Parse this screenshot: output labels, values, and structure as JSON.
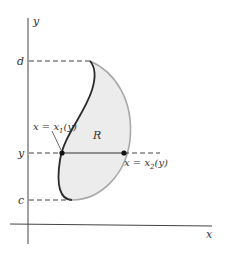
{
  "diagram": {
    "type": "region-between-curves",
    "axes": {
      "x_label": "x",
      "y_label": "y"
    },
    "levels": {
      "top": "d",
      "middle": "y",
      "bottom": "c"
    },
    "region_label": "R",
    "left_curve_label": {
      "lhs": "x = x",
      "sub": "1",
      "rhs": "(y)"
    },
    "right_curve_label": {
      "lhs": "x = x",
      "sub": "2",
      "rhs": "(y)"
    },
    "colors": {
      "region_fill": "#ececec",
      "left_curve": "#2a2a2a",
      "right_curve": "#a8a8a8",
      "axis": "#444444",
      "dash": "#444444"
    }
  }
}
